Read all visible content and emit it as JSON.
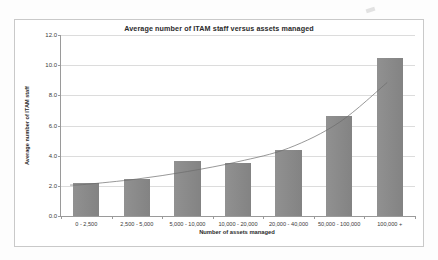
{
  "chart_data": {
    "type": "bar",
    "title": "Average number of ITAM staff versus assets managed",
    "xlabel": "Number of assets managed",
    "ylabel": "Average number of ITAM staff",
    "categories": [
      "0 - 2,500",
      "2,500 - 5,000",
      "5,000 - 10,000",
      "10,000 - 20,000",
      "20,000 - 40,000",
      "50,000 - 100,000",
      "100,000 +"
    ],
    "values": [
      2.2,
      2.45,
      3.65,
      3.5,
      4.4,
      6.6,
      10.5
    ],
    "ylim": [
      0,
      12
    ],
    "ytick_labels": [
      "0.0",
      "2.0",
      "4.0",
      "6.0",
      "8.0",
      "10.0",
      "12.0"
    ],
    "ytick_values": [
      0,
      2,
      4,
      6,
      8,
      10,
      12
    ],
    "grid": true,
    "legend": "none",
    "series": [
      {
        "name": "Average number of ITAM staff",
        "values": [
          2.2,
          2.45,
          3.65,
          3.5,
          4.4,
          6.6,
          10.5
        ]
      }
    ],
    "trendline": {
      "type": "exponential",
      "points": [
        2.1,
        2.45,
        2.95,
        3.6,
        4.5,
        6.2,
        8.7
      ],
      "color": "#6b6b6b"
    },
    "colors": {
      "bar": "#8a8a8a",
      "grid": "#dcdcdc",
      "axis": "#9a9a9a",
      "text": "#2b2b2b",
      "frame": "#c9c9c9",
      "background": "#ffffff"
    }
  }
}
